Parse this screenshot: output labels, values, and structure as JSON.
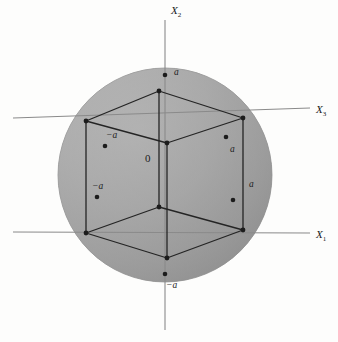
{
  "figure": {
    "background_color": "#fdfdfc"
  },
  "sphere": {
    "center_x": 165,
    "center_y": 175,
    "radius": 107,
    "fill_light": "#b4b4b4",
    "fill_dark": "#8d8d8d",
    "edge_color": "#7e7e7e"
  },
  "axes": [
    {
      "name": "x2-axis",
      "label": "X",
      "subscript": "2",
      "label_x": 171,
      "label_y": 14,
      "x1": 165,
      "y1": 20,
      "x2": 165,
      "y2": 330,
      "color": "#8a8a8a"
    },
    {
      "name": "x3-axis",
      "label": "X",
      "subscript": "3",
      "label_x": 316,
      "label_y": 113,
      "x1": 13,
      "y1": 118,
      "x2": 310,
      "y2": 108,
      "color": "#8a8a8a"
    },
    {
      "name": "x1-axis",
      "label": "X",
      "subscript": "1",
      "label_x": 316,
      "label_y": 238,
      "x1": 13,
      "y1": 232,
      "x2": 310,
      "y2": 233,
      "color": "#8a8a8a"
    }
  ],
  "cube": {
    "edge_color": "#242424",
    "vertices": [
      {
        "name": "top-back",
        "x": 159,
        "y": 91
      },
      {
        "name": "top-left",
        "x": 86,
        "y": 121
      },
      {
        "name": "top-right",
        "x": 243,
        "y": 118
      },
      {
        "name": "top-front",
        "x": 167,
        "y": 143
      },
      {
        "name": "bottom-back",
        "x": 159,
        "y": 207
      },
      {
        "name": "bottom-left",
        "x": 86,
        "y": 233
      },
      {
        "name": "bottom-right",
        "x": 243,
        "y": 230
      },
      {
        "name": "bottom-front",
        "x": 167,
        "y": 258
      }
    ]
  },
  "markers": [
    {
      "name": "marker-x2-positive",
      "x": 165,
      "y": 75,
      "label": "a",
      "label_x": 174,
      "label_y": 75
    },
    {
      "name": "marker-x2-negative",
      "x": 165,
      "y": 274,
      "label": "−a",
      "label_x": 166,
      "label_y": 288
    },
    {
      "name": "marker-x3-negative",
      "x": 105,
      "y": 146,
      "label": "−a",
      "label_x": 106,
      "label_y": 138
    },
    {
      "name": "marker-x3-positive",
      "x": 226,
      "y": 137,
      "label": "a",
      "label_x": 230,
      "label_y": 152
    },
    {
      "name": "marker-x1-negative",
      "x": 97,
      "y": 197,
      "label": "−a",
      "label_x": 92,
      "label_y": 189
    },
    {
      "name": "marker-x1-positive",
      "x": 233,
      "y": 200,
      "label": "a",
      "label_x": 249,
      "label_y": 187
    }
  ],
  "origin": {
    "name": "origin-label",
    "label": "0",
    "x": 145,
    "y": 162
  }
}
